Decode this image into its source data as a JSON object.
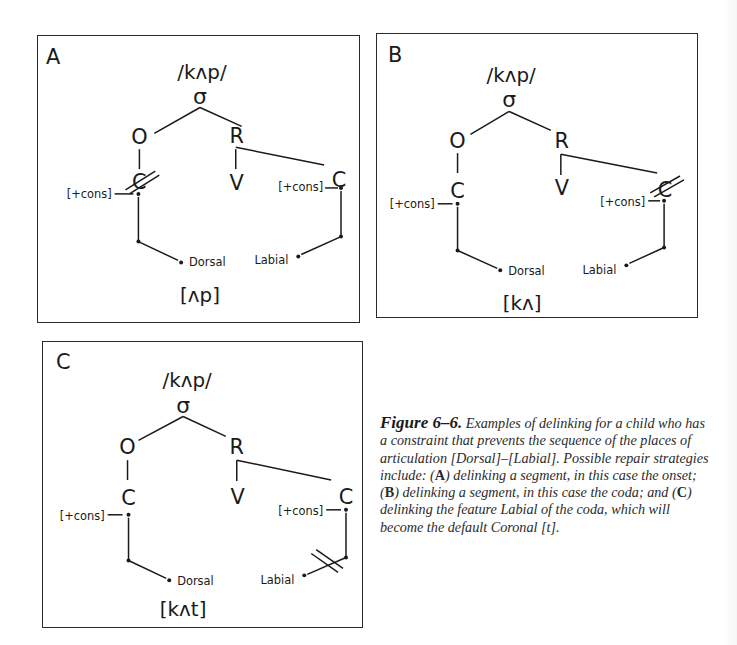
{
  "panels": [
    {
      "id": "A",
      "label": "A",
      "underlying": "/kʌp/",
      "syllable": "σ",
      "onset": "O",
      "rime": "R",
      "vowel": "V",
      "onset_segment": "C",
      "coda_segment": "C",
      "onset_feature": "[+cons]",
      "coda_feature": "[+cons]",
      "onset_place": "Dorsal",
      "coda_place": "Labial",
      "output": "[ʌp]",
      "delinked": "onset"
    },
    {
      "id": "B",
      "label": "B",
      "underlying": "/kʌp/",
      "syllable": "σ",
      "onset": "O",
      "rime": "R",
      "vowel": "V",
      "onset_segment": "C",
      "coda_segment": "C",
      "onset_feature": "[+cons]",
      "coda_feature": "[+cons]",
      "onset_place": "Dorsal",
      "coda_place": "Labial",
      "output": "[kʌ]",
      "delinked": "coda"
    },
    {
      "id": "C",
      "label": "C",
      "underlying": "/kʌp/",
      "syllable": "σ",
      "onset": "O",
      "rime": "R",
      "vowel": "V",
      "onset_segment": "C",
      "coda_segment": "C",
      "onset_feature": "[+cons]",
      "coda_feature": "[+cons]",
      "onset_place": "Dorsal",
      "coda_place": "Labial",
      "output": "[kʌt]",
      "delinked": "coda-labial-feature"
    }
  ],
  "caption": {
    "figure_label": "Figure 6–6.",
    "text_1": " Examples of delinking for a child who has a constraint that prevents the sequence of the places of articulation [Dorsal]–[Labial]. Possible repair strategies include: (",
    "bold_a": "A",
    "text_2": ") delinking a segment, in this case the onset; (",
    "bold_b": "B",
    "text_3": ") delinking a segment, in this case the coda; and (",
    "bold_c": "C",
    "text_4": ") delinking the feature Labial of the coda, which will become the default Coronal [t]."
  }
}
